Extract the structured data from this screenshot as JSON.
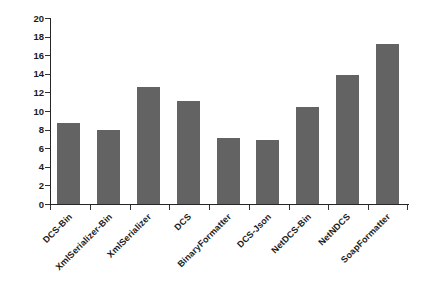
{
  "chart_data": {
    "type": "bar",
    "title": "",
    "xlabel": "",
    "ylabel": "Serialized Size (MB)",
    "ylim": [
      0,
      20
    ],
    "yticks": [
      0,
      2,
      4,
      6,
      8,
      10,
      12,
      14,
      16,
      18,
      20
    ],
    "ytick_labels": [
      "0",
      "2",
      "4",
      "6",
      "8",
      "10",
      "12",
      "14",
      "16",
      "18",
      "20"
    ],
    "grid": false,
    "legend": false,
    "legend_position": "none",
    "bar_color": "#636363",
    "axis_color": "#262626",
    "categories": [
      "DCS-Bin",
      "XmlSerializer-Bin",
      "XmlSerializer",
      "DCS",
      "BinaryFormatter",
      "DCS-Json",
      "NetDCS-Bin",
      "NetNDCS",
      "SoapFormatter"
    ],
    "values": [
      8.7,
      8.0,
      12.6,
      11.1,
      7.15,
      6.85,
      10.4,
      13.9,
      17.2
    ],
    "series": [
      {
        "name": "Serialized Size (MB)",
        "values": [
          8.7,
          8.0,
          12.6,
          11.1,
          7.15,
          6.85,
          10.4,
          13.9,
          17.2
        ]
      }
    ]
  }
}
